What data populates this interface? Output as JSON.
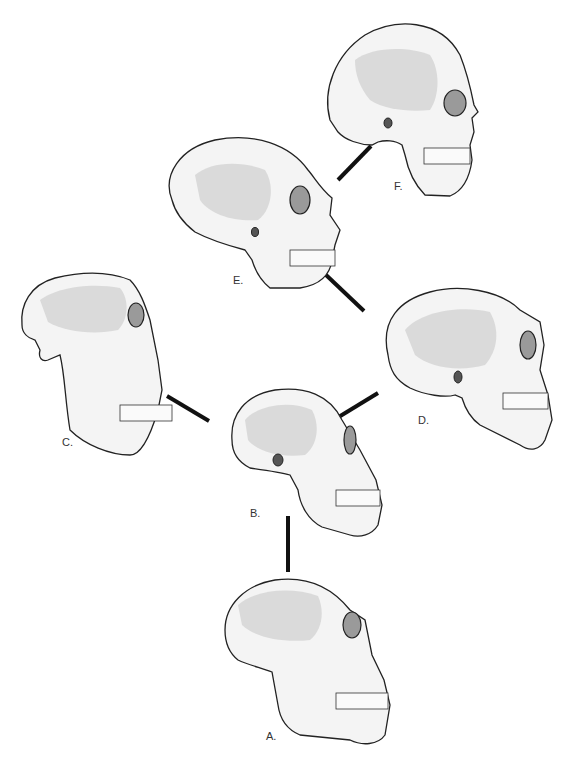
{
  "figure": {
    "skulls": [
      {
        "id": "A",
        "label": "A."
      },
      {
        "id": "B",
        "label": "B."
      },
      {
        "id": "C",
        "label": "C."
      },
      {
        "id": "D",
        "label": "D."
      },
      {
        "id": "E",
        "label": "E."
      },
      {
        "id": "F",
        "label": "F."
      }
    ],
    "connections": [
      {
        "from": "A",
        "to": "B"
      },
      {
        "from": "B",
        "to": "C"
      },
      {
        "from": "B",
        "to": "D"
      },
      {
        "from": "D",
        "to": "E"
      },
      {
        "from": "E",
        "to": "F"
      }
    ]
  }
}
